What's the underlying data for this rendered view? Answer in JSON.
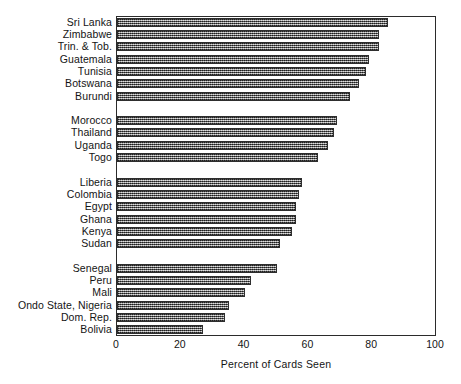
{
  "chart_data": {
    "type": "bar",
    "orientation": "horizontal",
    "title": "",
    "xlabel": "Percent of Cards Seen",
    "ylabel": "",
    "xlim": [
      0,
      100
    ],
    "xticks": [
      0,
      20,
      40,
      60,
      80,
      100
    ],
    "grid": false,
    "legend": false,
    "categories": [
      "Sri Lanka",
      "Zimbabwe",
      "Trin. & Tob.",
      "Guatemala",
      "Tunisia",
      "Botswana",
      "Burundi",
      "Morocco",
      "Thailand",
      "Uganda",
      "Togo",
      "Liberia",
      "Colombia",
      "Egypt",
      "Ghana",
      "Kenya",
      "Sudan",
      "Senegal",
      "Peru",
      "Mali",
      "Ondo State, Nigeria",
      "Dom. Rep.",
      "Bolivia"
    ],
    "values": [
      85,
      82,
      82,
      79,
      78,
      76,
      73,
      69,
      68,
      66,
      63,
      58,
      57,
      56,
      56,
      55,
      51,
      50,
      42,
      40,
      35,
      34,
      27
    ],
    "groups": [
      {
        "name": "group-1",
        "size": 7
      },
      {
        "name": "group-2",
        "size": 4
      },
      {
        "name": "group-3",
        "size": 6
      },
      {
        "name": "group-4",
        "size": 6
      }
    ],
    "colors": {
      "bar_fill": "#7d7d7d",
      "bar_edge": "#2e2e2e",
      "axis": "#2b2b2b",
      "text": "#141414",
      "background": "#ffffff"
    }
  }
}
